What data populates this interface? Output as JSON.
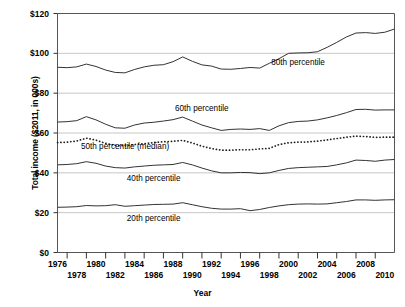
{
  "chart_data": {
    "type": "line",
    "title": "",
    "xlabel": "Year",
    "ylabel": "Total income ($2011, in 000s)",
    "xlim": [
      1976,
      2011
    ],
    "ylim": [
      0,
      120
    ],
    "yticks": [
      "$0",
      "$20",
      "$40",
      "$60",
      "$80",
      "$100",
      "$120"
    ],
    "ytick_values": [
      0,
      20,
      40,
      60,
      80,
      100,
      120
    ],
    "xticks_top": [
      "1976",
      "1980",
      "1984",
      "1988",
      "1992",
      "1996",
      "2000",
      "2004",
      "2008"
    ],
    "xticks_bottom": [
      "1978",
      "1982",
      "1986",
      "1990",
      "1994",
      "1998",
      "2002",
      "2006",
      "2010"
    ],
    "xtick_top_values": [
      1976,
      1980,
      1984,
      1988,
      1992,
      1996,
      2000,
      2004,
      2008
    ],
    "xtick_bottom_values": [
      1978,
      1982,
      1986,
      1990,
      1994,
      1998,
      2002,
      2006,
      2010
    ],
    "grid": "horizontal",
    "legend_position": "inline-annotations",
    "x": [
      1976,
      1977,
      1978,
      1979,
      1980,
      1981,
      1982,
      1983,
      1984,
      1985,
      1986,
      1987,
      1988,
      1989,
      1990,
      1991,
      1992,
      1993,
      1994,
      1995,
      1996,
      1997,
      1998,
      1999,
      2000,
      2001,
      2002,
      2003,
      2004,
      2005,
      2006,
      2007,
      2008,
      2009,
      2010,
      2011
    ],
    "series": [
      {
        "name": "80th percentile",
        "style": "solid",
        "color": "#333333",
        "label_x": 2001,
        "label_y": 95,
        "values": [
          93.0,
          92.8,
          93.2,
          94.6,
          93.4,
          91.6,
          90.4,
          90.2,
          91.9,
          93.2,
          94.0,
          94.3,
          95.8,
          98.2,
          96.0,
          94.2,
          93.6,
          92.1,
          92.0,
          92.4,
          92.9,
          92.6,
          95.0,
          97.3,
          100.0,
          100.2,
          100.3,
          100.8,
          103.0,
          105.5,
          108.2,
          110.2,
          110.4,
          110.0,
          110.6,
          112.2
        ]
      },
      {
        "name": "60th percentile",
        "style": "solid",
        "color": "#333333",
        "label_x": 1991,
        "label_y": 72,
        "values": [
          65.5,
          65.7,
          66.2,
          68.2,
          66.6,
          64.4,
          62.6,
          62.4,
          64.0,
          65.0,
          65.4,
          66.0,
          66.7,
          68.0,
          66.0,
          64.0,
          62.6,
          61.3,
          61.8,
          62.0,
          61.8,
          62.2,
          61.3,
          63.6,
          65.2,
          65.8,
          66.0,
          66.6,
          67.6,
          68.8,
          70.2,
          71.8,
          71.9,
          71.5,
          71.6,
          71.6
        ]
      },
      {
        "name": "50th percentile (median)",
        "style": "dotted",
        "color": "#222222",
        "label_x": 1983,
        "label_y": 53,
        "values": [
          55.2,
          55.4,
          56.0,
          57.4,
          56.4,
          54.8,
          53.8,
          53.6,
          54.2,
          54.6,
          55.2,
          55.6,
          55.8,
          56.3,
          55.0,
          53.4,
          52.2,
          51.4,
          51.4,
          51.6,
          51.6,
          52.0,
          52.3,
          54.2,
          55.1,
          55.4,
          55.5,
          55.9,
          56.5,
          57.2,
          57.9,
          58.4,
          58.2,
          57.8,
          57.9,
          57.9
        ]
      },
      {
        "name": "40th percentile",
        "style": "solid",
        "color": "#333333",
        "label_x": 1986,
        "label_y": 37,
        "values": [
          44.0,
          44.2,
          44.6,
          45.6,
          44.8,
          43.4,
          42.6,
          42.4,
          43.0,
          43.4,
          43.8,
          44.0,
          44.2,
          45.2,
          44.0,
          42.4,
          41.0,
          40.0,
          40.0,
          40.2,
          40.1,
          39.6,
          40.0,
          41.2,
          42.2,
          42.6,
          42.8,
          43.0,
          43.2,
          44.0,
          45.0,
          46.4,
          46.2,
          45.8,
          46.4,
          46.7
        ]
      },
      {
        "name": "20th percentile",
        "style": "solid",
        "color": "#333333",
        "label_x": 1986,
        "label_y": 17,
        "values": [
          22.7,
          22.8,
          23.0,
          23.6,
          23.4,
          23.5,
          24.0,
          23.2,
          23.5,
          23.8,
          24.1,
          24.2,
          24.3,
          25.0,
          24.0,
          23.0,
          22.2,
          21.8,
          21.8,
          22.0,
          21.0,
          21.6,
          22.6,
          23.4,
          24.0,
          24.3,
          24.4,
          24.3,
          24.4,
          25.0,
          25.6,
          26.4,
          26.4,
          26.2,
          26.4,
          26.5
        ]
      }
    ]
  }
}
